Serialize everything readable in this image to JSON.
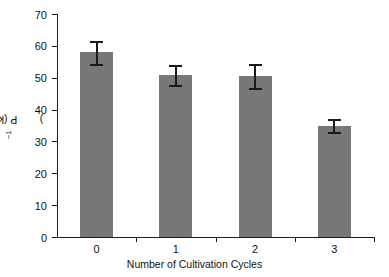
{
  "chart_data": {
    "type": "bar",
    "title": "",
    "xlabel": "Number of Cultivation Cycles",
    "ylabel": "P (kg ha⁻¹)",
    "ylabel_main": "P (kg ha",
    "ylabel_sup": "−1",
    "ylabel_tail": ")",
    "categories": [
      "0",
      "1",
      "2",
      "3"
    ],
    "values": [
      58.0,
      50.8,
      50.5,
      35.0
    ],
    "errors": [
      3.6,
      3.2,
      3.7,
      1.9
    ],
    "ylim": [
      0,
      70
    ],
    "yticks": [
      0,
      10,
      20,
      30,
      40,
      50,
      60,
      70
    ],
    "ytick_labels": [
      "0",
      "10",
      "20",
      "30",
      "40",
      "50",
      "60",
      "70"
    ],
    "grid": false,
    "legend": null,
    "bar_color": "#787878",
    "axis_color": "#1a1a1a",
    "error_bar_color": "#1a1a1a",
    "background_color": "#ffffff"
  }
}
